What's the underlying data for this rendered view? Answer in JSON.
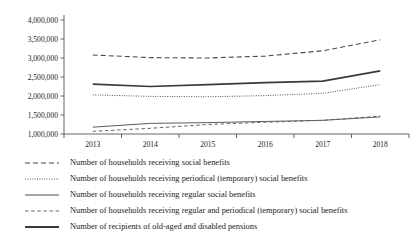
{
  "chart_data": {
    "type": "line",
    "title": "",
    "xlabel": "",
    "ylabel": "",
    "categories": [
      "2013",
      "2014",
      "2015",
      "2016",
      "2017",
      "2018"
    ],
    "ylim": [
      1000000,
      4000000
    ],
    "yticks": [
      1000000,
      1500000,
      2000000,
      2500000,
      3000000,
      3500000,
      4000000
    ],
    "ytick_labels": [
      "1,000,000",
      "1,500,000",
      "2,000,000",
      "2,500,000",
      "3,000,000",
      "3,500,000",
      "4,000,000"
    ],
    "grid": false,
    "legend_position": "bottom-left",
    "series": [
      {
        "name": "Number of households receiving social benefits",
        "style": "long-dash",
        "color": "#4a4a4a",
        "width": 1.1,
        "values": [
          3080000,
          3010000,
          3000000,
          3050000,
          3190000,
          3480000
        ]
      },
      {
        "name": "Number of households receiving periodical (temporary) social benefits",
        "style": "dotted",
        "color": "#555555",
        "width": 1.0,
        "values": [
          2030000,
          1990000,
          1980000,
          2010000,
          2070000,
          2300000
        ]
      },
      {
        "name": "Number of households receiving regular social benefits",
        "style": "solid-thin",
        "color": "#4a4a4a",
        "width": 0.9,
        "values": [
          1180000,
          1280000,
          1300000,
          1330000,
          1360000,
          1450000
        ]
      },
      {
        "name": "Number of households receiving regular and periodical (temporary) social benefits",
        "style": "short-dash",
        "color": "#666666",
        "width": 1.0,
        "values": [
          1070000,
          1150000,
          1250000,
          1310000,
          1360000,
          1470000
        ]
      },
      {
        "name": "Number of recipients of old-aged and disabled pensions",
        "style": "solid-thick",
        "color": "#3a3a3a",
        "width": 1.7,
        "values": [
          2310000,
          2250000,
          2300000,
          2350000,
          2390000,
          2660000
        ]
      }
    ]
  }
}
